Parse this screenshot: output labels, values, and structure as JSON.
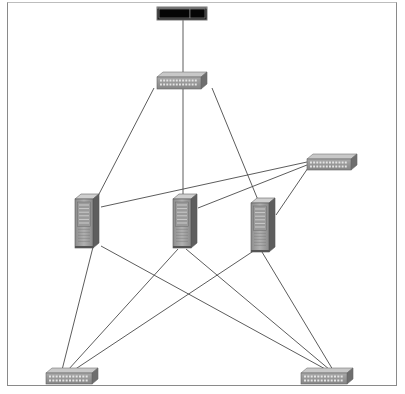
{
  "diagram": {
    "type": "network-topology",
    "colors": {
      "line": "#4a4a4a",
      "frame": "#8a8a8a",
      "device_face": "#9b9b9b",
      "device_top": "#c8c8c8",
      "device_side": "#6e6e6e",
      "rack_top": "#111111"
    },
    "nodes": [
      {
        "id": "top-rack",
        "kind": "rack-unit",
        "x": 157,
        "y": 7,
        "w": 50,
        "h": 13
      },
      {
        "id": "core-switch",
        "kind": "switch",
        "x": 157,
        "y": 72,
        "w": 50,
        "h": 17
      },
      {
        "id": "side-switch",
        "kind": "switch",
        "x": 307,
        "y": 154,
        "w": 50,
        "h": 16
      },
      {
        "id": "server-1",
        "kind": "server",
        "x": 75,
        "y": 194,
        "w": 24,
        "h": 54
      },
      {
        "id": "server-2",
        "kind": "server",
        "x": 173,
        "y": 194,
        "w": 24,
        "h": 54
      },
      {
        "id": "server-3",
        "kind": "server",
        "x": 251,
        "y": 198,
        "w": 24,
        "h": 54
      },
      {
        "id": "switch-bottom-left",
        "kind": "switch",
        "x": 46,
        "y": 368,
        "w": 52,
        "h": 16
      },
      {
        "id": "switch-bottom-right",
        "kind": "switch",
        "x": 301,
        "y": 368,
        "w": 52,
        "h": 16
      }
    ],
    "links": [
      {
        "from": [
          183,
          20
        ],
        "to": [
          183,
          72
        ]
      },
      {
        "from": [
          154,
          88
        ],
        "to": [
          98,
          196
        ]
      },
      {
        "from": [
          183,
          89
        ],
        "to": [
          183,
          196
        ]
      },
      {
        "from": [
          212,
          88
        ],
        "to": [
          258,
          200
        ]
      },
      {
        "from": [
          307,
          162
        ],
        "to": [
          101,
          207
        ]
      },
      {
        "from": [
          307,
          165
        ],
        "to": [
          198,
          208
        ]
      },
      {
        "from": [
          308,
          168
        ],
        "to": [
          276,
          215
        ]
      },
      {
        "from": [
          93,
          247
        ],
        "to": [
          62,
          370
        ]
      },
      {
        "from": [
          101,
          246
        ],
        "to": [
          327,
          370
        ]
      },
      {
        "from": [
          178,
          249
        ],
        "to": [
          68,
          370
        ]
      },
      {
        "from": [
          186,
          249
        ],
        "to": [
          330,
          370
        ]
      },
      {
        "from": [
          255,
          250
        ],
        "to": [
          74,
          370
        ]
      },
      {
        "from": [
          262,
          252
        ],
        "to": [
          333,
          370
        ]
      }
    ]
  }
}
